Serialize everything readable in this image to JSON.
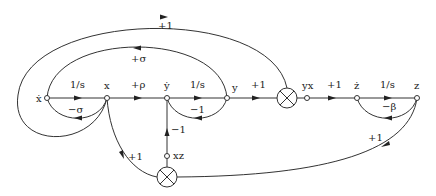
{
  "diagram": {
    "nodes": {
      "x_dot": "ẋ",
      "x": "x",
      "y_dot": "ẏ",
      "y": "y",
      "yx": "yx",
      "z_dot": "ż",
      "z": "z",
      "xz": "xz"
    },
    "gains": {
      "xdot_to_x": "1/s",
      "x_to_ydot": "+ρ",
      "ydot_to_y": "1/s",
      "y_to_mult": "+1",
      "yx_to_zdot": "+1",
      "zdot_to_z": "1/s",
      "x_to_xdot": "−σ",
      "y_to_ydot": "−1",
      "z_to_zdot": "−β",
      "y_to_xdot": "+σ",
      "x_to_upper_mult": "+1",
      "x_to_lower_mult": "+1",
      "z_to_lower_mult": "+1",
      "xz_to_ydot": "−1"
    },
    "colors": {
      "stroke": "#333333",
      "text": "#222222",
      "background": "#ffffff"
    }
  }
}
